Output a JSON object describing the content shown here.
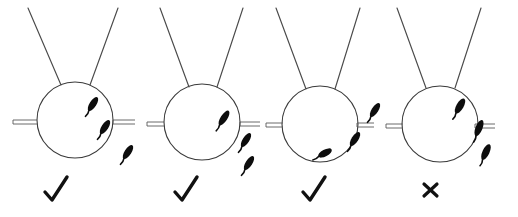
{
  "figure": {
    "title": "",
    "background_color": "#ffffff",
    "width": 518,
    "height": 217,
    "line_color": "#3a3a3a",
    "mark_color": "#0d0d0d",
    "verdict_color": "#111111"
  },
  "chart_data": {
    "type": "diagram",
    "title": "",
    "xlabel": "",
    "ylabel": "",
    "panel_count": 4,
    "legend": [],
    "annotations": [],
    "panels": [
      {
        "index": 1,
        "name": "panel-1",
        "verdict": "check",
        "verdict_label": "✓",
        "circle": {
          "cx": 75,
          "cy": 120,
          "r": 38
        },
        "antennae": [
          {
            "x1": 28,
            "y1": 8,
            "x2": 61,
            "y2": 85
          },
          {
            "x1": 118,
            "y1": 8,
            "x2": 90,
            "y2": 85
          }
        ],
        "ticks": [
          {
            "side": "left",
            "x1": 13,
            "y1": 122,
            "x2": 37,
            "y2": 122
          },
          {
            "side": "right",
            "x1": 113,
            "y1": 122,
            "x2": 135,
            "y2": 122
          }
        ],
        "marks": [
          {
            "cx": 93,
            "cy": 104,
            "rx": 3.4,
            "ry": 8.0,
            "angle": 33,
            "tail_len": 7
          },
          {
            "cx": 105,
            "cy": 127,
            "rx": 3.4,
            "ry": 8.0,
            "angle": 33,
            "tail_len": 7
          },
          {
            "cx": 128,
            "cy": 152,
            "rx": 3.4,
            "ry": 8.0,
            "angle": 33,
            "tail_len": 7
          }
        ]
      },
      {
        "index": 2,
        "name": "panel-2",
        "verdict": "check",
        "verdict_label": "✓",
        "circle": {
          "cx": 202,
          "cy": 122,
          "r": 38
        },
        "antennae": [
          {
            "x1": 160,
            "y1": 8,
            "x2": 189,
            "y2": 87
          },
          {
            "x1": 243,
            "y1": 8,
            "x2": 217,
            "y2": 87
          }
        ],
        "ticks": [
          {
            "side": "left",
            "x1": 147,
            "y1": 124,
            "x2": 164,
            "y2": 124
          },
          {
            "side": "right",
            "x1": 240,
            "y1": 124,
            "x2": 260,
            "y2": 124
          }
        ],
        "marks": [
          {
            "cx": 224,
            "cy": 118,
            "rx": 3.4,
            "ry": 8.5,
            "angle": 33,
            "tail_len": 7
          },
          {
            "cx": 246,
            "cy": 140,
            "rx": 3.3,
            "ry": 8.0,
            "angle": 33,
            "tail_len": 7
          },
          {
            "cx": 249,
            "cy": 163,
            "rx": 3.3,
            "ry": 8.0,
            "angle": 33,
            "tail_len": 7
          }
        ]
      },
      {
        "index": 3,
        "name": "panel-3",
        "verdict": "check",
        "verdict_label": "✓",
        "circle": {
          "cx": 320,
          "cy": 124,
          "r": 38
        },
        "antennae": [
          {
            "x1": 276,
            "y1": 8,
            "x2": 306,
            "y2": 89
          },
          {
            "x1": 360,
            "y1": 8,
            "x2": 335,
            "y2": 89
          }
        ],
        "ticks": [
          {
            "side": "left",
            "x1": 266,
            "y1": 125,
            "x2": 283,
            "y2": 125
          },
          {
            "side": "right",
            "x1": 357,
            "y1": 125,
            "x2": 374,
            "y2": 125
          }
        ],
        "marks": [
          {
            "cx": 375,
            "cy": 110,
            "rx": 3.3,
            "ry": 8.0,
            "angle": 33,
            "tail_len": 7
          },
          {
            "cx": 355,
            "cy": 139,
            "rx": 3.4,
            "ry": 8.0,
            "angle": 33,
            "tail_len": 7
          },
          {
            "cx": 325,
            "cy": 153,
            "rx": 3.4,
            "ry": 7.5,
            "angle": 62,
            "tail_len": 7
          }
        ]
      },
      {
        "index": 4,
        "name": "panel-4",
        "verdict": "cross",
        "verdict_label": "×",
        "circle": {
          "cx": 440,
          "cy": 124,
          "r": 38
        },
        "antennae": [
          {
            "x1": 397,
            "y1": 8,
            "x2": 426,
            "y2": 88
          },
          {
            "x1": 481,
            "y1": 8,
            "x2": 455,
            "y2": 88
          }
        ],
        "ticks": [
          {
            "side": "left",
            "x1": 386,
            "y1": 126,
            "x2": 403,
            "y2": 126
          },
          {
            "side": "right",
            "x1": 475,
            "y1": 126,
            "x2": 495,
            "y2": 126
          }
        ],
        "marks": [
          {
            "cx": 460,
            "cy": 106,
            "rx": 3.6,
            "ry": 8.5,
            "angle": 30,
            "tail_len": 7
          },
          {
            "cx": 479,
            "cy": 128,
            "rx": 3.5,
            "ry": 8.5,
            "angle": 22,
            "tail_len": 7
          },
          {
            "cx": 486,
            "cy": 152,
            "rx": 3.5,
            "ry": 8.5,
            "angle": 25,
            "tail_len": 7
          }
        ]
      }
    ],
    "verdicts": [
      {
        "panel": 1,
        "symbol": "check",
        "x": 45,
        "y": 190
      },
      {
        "panel": 2,
        "symbol": "check",
        "x": 175,
        "y": 190
      },
      {
        "panel": 3,
        "symbol": "check",
        "x": 303,
        "y": 190
      },
      {
        "panel": 4,
        "symbol": "cross",
        "x": 424,
        "y": 190
      }
    ]
  }
}
